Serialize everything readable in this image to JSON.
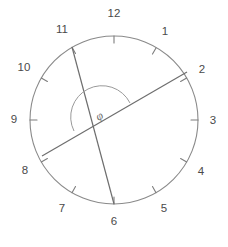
{
  "diagram": {
    "background_color": "#ffffff",
    "circle": {
      "center_x": 114,
      "center_y": 120,
      "radius": 84,
      "stroke_color": "#8a8a8a",
      "stroke_width": 1.1
    },
    "tick_marks": {
      "count": 12,
      "length": 7,
      "stroke_color": "#7d7d7d",
      "stroke_width": 1.1,
      "direction": "inward"
    },
    "hour_labels": [
      {
        "label": "12",
        "hour": 12,
        "angle_deg": 0,
        "x": 114,
        "y": 14
      },
      {
        "label": "1",
        "hour": 1,
        "angle_deg": 30,
        "x": 165,
        "y": 32
      },
      {
        "label": "2",
        "hour": 2,
        "angle_deg": 60,
        "x": 202,
        "y": 70
      },
      {
        "label": "3",
        "hour": 3,
        "angle_deg": 90,
        "x": 213,
        "y": 121
      },
      {
        "label": "4",
        "hour": 4,
        "angle_deg": 120,
        "x": 201,
        "y": 172
      },
      {
        "label": "5",
        "hour": 5,
        "angle_deg": 150,
        "x": 164,
        "y": 209
      },
      {
        "label": "6",
        "hour": 6,
        "angle_deg": 180,
        "x": 114,
        "y": 222
      },
      {
        "label": "7",
        "hour": 7,
        "angle_deg": 210,
        "x": 62,
        "y": 209
      },
      {
        "label": "8",
        "hour": 8,
        "angle_deg": 240,
        "x": 25,
        "y": 171
      },
      {
        "label": "9",
        "hour": 9,
        "angle_deg": 270,
        "x": 14,
        "y": 120
      },
      {
        "label": "10",
        "hour": 10,
        "angle_deg": 300,
        "x": 24,
        "y": 68
      },
      {
        "label": "11",
        "hour": 11,
        "angle_deg": 330,
        "x": 62,
        "y": 30
      }
    ],
    "chords": [
      {
        "name": "chord-eleven-to-six",
        "from_hour": 11,
        "to_hour": 6,
        "x1": 72,
        "y1": 47,
        "x2": 114,
        "y2": 204,
        "stroke_color": "#6e6e6e",
        "stroke_width": 1.2
      },
      {
        "name": "chord-eight-to-two",
        "from_hour": 8,
        "to_hour": 2,
        "x1": 42,
        "y1": 156,
        "x2": 187,
        "y2": 72,
        "stroke_color": "#6e6e6e",
        "stroke_width": 1.2
      }
    ],
    "angle_marker": {
      "symbol": "φ",
      "label_x": 100,
      "label_y": 117,
      "arc_radius": 28,
      "stroke_color": "#9a9a9a",
      "stroke_width": 1.0,
      "arc_path": "M 74 131 A 28 28 0 0 1 130 103"
    }
  }
}
